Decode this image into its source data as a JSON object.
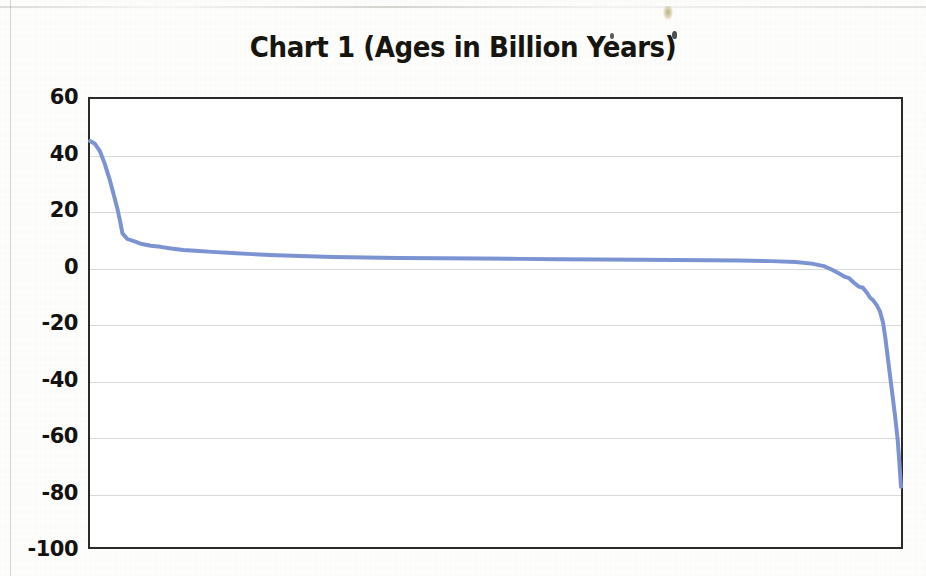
{
  "page": {
    "background_color": "#fdfdfb",
    "artifact_note": "scanned page with faint noise, edge scan line and a small yellow smudge near the top"
  },
  "chart_title": "Chart 1 (Ages in Billion Years)",
  "colors": {
    "series_line": "#7b93d1",
    "axis_border": "#2b2a28",
    "gridline": "#9a9a9a",
    "text": "#141210",
    "plot_background": "#ffffff"
  },
  "chart_data": {
    "type": "line",
    "title": "Chart 1 (Ages in Billion Years)",
    "xlabel": "",
    "ylabel": "",
    "ylim": [
      -100,
      60
    ],
    "xlim": [
      0,
      100
    ],
    "grid": true,
    "legend": false,
    "y_ticks": [
      60,
      40,
      20,
      0,
      -20,
      -40,
      -60,
      -80,
      -100
    ],
    "y_tick_labels": [
      "60",
      "40",
      "20",
      "0",
      "-20",
      "-40",
      "-60",
      "-80",
      "-100"
    ],
    "x_ticks": [],
    "x_tick_labels": [],
    "series": [
      {
        "name": "Ages in Billion Years",
        "color": "#7b93d1",
        "line_width": 4,
        "x": [
          0.0,
          0.6,
          1.2,
          1.8,
          2.4,
          3.0,
          3.4,
          3.7,
          4.0,
          4.6,
          5.4,
          6.4,
          7.5,
          8.7,
          10.0,
          11.5,
          13.0,
          15.0,
          17.5,
          20.0,
          23.0,
          26.0,
          30.0,
          34.0,
          38.0,
          43.0,
          48.0,
          53.0,
          58.0,
          63.0,
          68.0,
          72.0,
          76.0,
          80.0,
          84.0,
          87.0,
          89.0,
          90.5,
          91.5,
          92.3,
          93.0,
          93.6,
          94.2,
          94.8,
          95.3,
          95.8,
          96.2,
          96.6,
          97.0,
          97.4,
          97.8,
          98.1,
          98.4,
          98.7,
          99.0,
          99.3,
          99.6,
          99.8,
          100.0
        ],
        "y": [
          45.0,
          44.0,
          41.5,
          37.0,
          31.5,
          25.0,
          20.5,
          16.5,
          12.0,
          10.0,
          9.2,
          8.2,
          7.6,
          7.2,
          6.6,
          6.1,
          5.8,
          5.4,
          5.0,
          4.6,
          4.2,
          3.9,
          3.6,
          3.4,
          3.2,
          3.1,
          3.0,
          2.9,
          2.8,
          2.7,
          2.6,
          2.5,
          2.4,
          2.3,
          2.1,
          1.8,
          1.2,
          0.3,
          -1.0,
          -2.2,
          -3.4,
          -4.0,
          -5.6,
          -7.0,
          -7.4,
          -9.2,
          -11.0,
          -12.0,
          -13.6,
          -15.8,
          -20.0,
          -26.0,
          -33.0,
          -40.0,
          -47.0,
          -54.0,
          -62.0,
          -70.0,
          -78.5
        ]
      }
    ]
  }
}
